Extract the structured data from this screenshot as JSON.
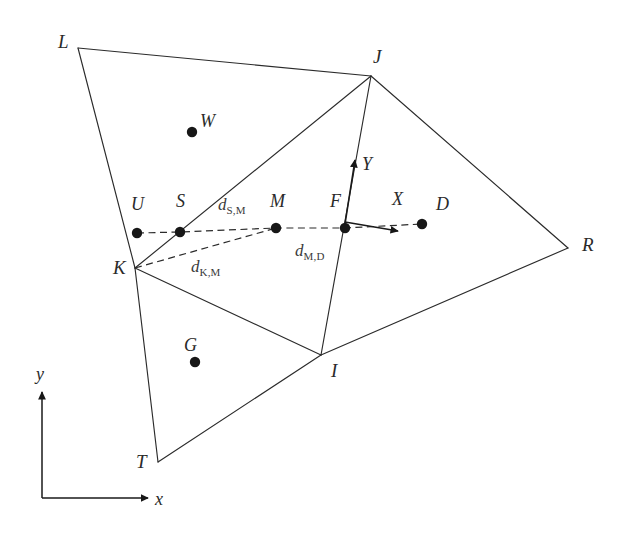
{
  "figure": {
    "type": "geometry-diagram",
    "background_color": "#ffffff",
    "line_color": "#2b2b2b",
    "marker_color": "#171717"
  },
  "vertices": [
    {
      "id": "L",
      "label": "L",
      "x": 78,
      "y": 48,
      "label_x": 58,
      "label_y": 32
    },
    {
      "id": "J",
      "label": "J",
      "x": 371,
      "y": 76,
      "label_x": 373,
      "label_y": 47
    },
    {
      "id": "R",
      "label": "R",
      "x": 568,
      "y": 248,
      "label_x": 582,
      "label_y": 235
    },
    {
      "id": "K",
      "label": "K",
      "x": 135,
      "y": 268,
      "label_x": 113,
      "label_y": 258
    },
    {
      "id": "I",
      "label": "I",
      "x": 321,
      "y": 355,
      "label_x": 331,
      "label_y": 361
    },
    {
      "id": "T",
      "label": "T",
      "x": 158,
      "y": 462,
      "label_x": 136,
      "label_y": 452
    }
  ],
  "points": [
    {
      "id": "W",
      "label": "W",
      "x": 192,
      "y": 132,
      "label_x": 200,
      "label_y": 112
    },
    {
      "id": "U",
      "label": "U",
      "x": 137,
      "y": 233,
      "label_x": 131,
      "label_y": 195
    },
    {
      "id": "S",
      "label": "S",
      "x": 180,
      "y": 232,
      "label_x": 176,
      "label_y": 192
    },
    {
      "id": "M",
      "label": "M",
      "x": 276,
      "y": 228,
      "label_x": 270,
      "label_y": 192
    },
    {
      "id": "F",
      "label": "F",
      "x": 345,
      "y": 228,
      "label_x": 330,
      "label_y": 192
    },
    {
      "id": "D",
      "label": "D",
      "x": 422,
      "y": 224,
      "label_x": 436,
      "label_y": 195
    },
    {
      "id": "G",
      "label": "G",
      "x": 195,
      "y": 362,
      "label_x": 184,
      "label_y": 336
    }
  ],
  "edges": [
    {
      "from": "L",
      "to": "J"
    },
    {
      "from": "L",
      "to": "K"
    },
    {
      "from": "K",
      "to": "J"
    },
    {
      "from": "J",
      "to": "I"
    },
    {
      "from": "J",
      "to": "R"
    },
    {
      "from": "R",
      "to": "I"
    },
    {
      "from": "K",
      "to": "I"
    },
    {
      "from": "K",
      "to": "T"
    },
    {
      "from": "T",
      "to": "I"
    }
  ],
  "dashed_path": {
    "name": "measurement-path",
    "nodes": [
      "U",
      "S",
      "M",
      "F",
      "D"
    ]
  },
  "dashed_chord": {
    "name": "k-to-m-chord",
    "from": "K",
    "to": "M"
  },
  "distance_labels": [
    {
      "id": "d_SM",
      "base": "d",
      "sub": "S,M",
      "x": 218,
      "y": 196
    },
    {
      "id": "d_KM",
      "base": "d",
      "sub": "K,M",
      "x": 191,
      "y": 258
    },
    {
      "id": "d_MD",
      "base": "d",
      "sub": "M,D",
      "x": 295,
      "y": 242
    }
  ],
  "local_frame": {
    "origin_point": "F",
    "x_axis": {
      "label": "X",
      "label_x": 392,
      "label_y": 190,
      "tip_x": 398,
      "tip_y": 231,
      "tail_x": 345,
      "tail_y": 222
    },
    "y_axis": {
      "label": "Y",
      "label_x": 362,
      "label_y": 155,
      "tip_x": 355,
      "tip_y": 160,
      "tail_x": 345,
      "tail_y": 224
    }
  },
  "global_axes": {
    "origin_x": 42,
    "origin_y": 498,
    "x_axis": {
      "label": "x",
      "label_x": 155,
      "label_y": 490,
      "length": 106
    },
    "y_axis": {
      "label": "y",
      "label_x": 36,
      "label_y": 365,
      "length": 106
    }
  }
}
